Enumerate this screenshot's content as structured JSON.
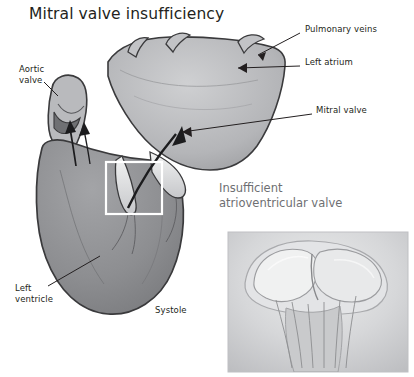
{
  "title": "Mitral valve insufficiency",
  "inset": {
    "title": "Insufficient\natrioventricular valve"
  },
  "labels": [
    {
      "id": "pulmonary-veins",
      "text": "Pulmonary veins",
      "x": 305,
      "y": 29
    },
    {
      "id": "left-atrium",
      "text": "Left atrium",
      "x": 305,
      "y": 62
    },
    {
      "id": "mitral-valve",
      "text": "Mitral valve",
      "x": 316,
      "y": 110
    },
    {
      "id": "aortic-valve",
      "text": "Aortic\nvalve",
      "x": 19,
      "y": 64
    },
    {
      "id": "left-ventricle",
      "text": "Left\nventricle",
      "x": 15,
      "y": 288
    },
    {
      "id": "systole",
      "text": "Systole",
      "x": 155,
      "y": 310
    }
  ],
  "colors": {
    "text": "#231f20",
    "inset_text": "#6e6f72",
    "heart_fill": "#8c8d90",
    "atrium_fill": "#b6b7ba",
    "outline": "#3a3a3c",
    "background": "#ffffff",
    "inset_bg": "#d9dadc",
    "valve_light": "#e7e8ea"
  }
}
